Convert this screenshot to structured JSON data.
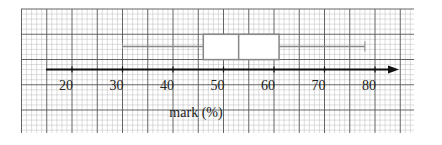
{
  "chart_data": {
    "type": "boxplot",
    "title": "",
    "xlabel": "mark (%)",
    "ylabel": "",
    "xlim": [
      15,
      85
    ],
    "x_ticks": [
      20,
      30,
      40,
      50,
      60,
      70,
      80
    ],
    "tick_labels": [
      "20",
      "30",
      "40",
      "50",
      "60",
      "70",
      "80"
    ],
    "grid": true,
    "grid_style": "graph paper (major every 10 units, minor every 2 units)",
    "legend": null,
    "boxplot": {
      "min": 30,
      "q1": 46,
      "median": 53,
      "q3": 61,
      "max": 78
    }
  },
  "colors": {
    "grid_major": "#555555",
    "grid_minor": "#bbbbbb",
    "box_stroke": "#888888",
    "axis": "#111111",
    "background": "#ffffff"
  }
}
